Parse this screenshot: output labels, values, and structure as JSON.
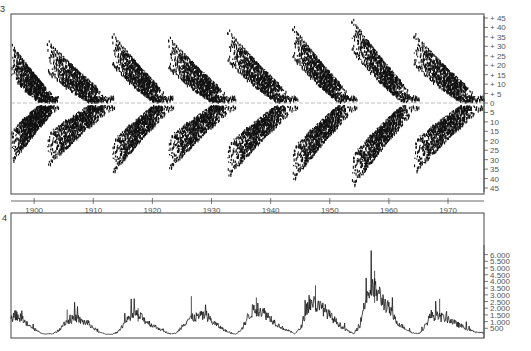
{
  "chart_data": [
    {
      "type": "scatter",
      "panel_label": "3",
      "title": "",
      "xlabel": "",
      "ylabel": "",
      "description": "Sunspot butterfly diagram: latitude of sunspot occurrence vs. time",
      "xlim": [
        1896,
        1976
      ],
      "ylim": [
        -45,
        45
      ],
      "x_ticks": [
        "1900",
        "1910",
        "1920",
        "1930",
        "1940",
        "1950",
        "1960",
        "1970"
      ],
      "y_ticks": [
        "+ 45",
        "+ 40",
        "+ 35",
        "+ 30",
        "+ 25",
        "+ 20",
        "+ 15",
        "+ 10",
        "+ 5",
        "0",
        "5",
        "10",
        "15",
        "20",
        "25",
        "30",
        "35",
        "40",
        "45"
      ],
      "y_tick_values": [
        45,
        40,
        35,
        30,
        25,
        20,
        15,
        10,
        5,
        0,
        -5,
        -10,
        -15,
        -20,
        -25,
        -30,
        -35,
        -40,
        -45
      ],
      "equator_line": true,
      "cycles": [
        {
          "start": 1896.0,
          "end": 1904.0,
          "max_lat": 30,
          "min_lat": 3
        },
        {
          "start": 1902.0,
          "end": 1913.5,
          "max_lat": 32,
          "min_lat": 3
        },
        {
          "start": 1913.0,
          "end": 1923.5,
          "max_lat": 36,
          "min_lat": 3
        },
        {
          "start": 1922.5,
          "end": 1934.0,
          "max_lat": 34,
          "min_lat": 3
        },
        {
          "start": 1932.5,
          "end": 1944.5,
          "max_lat": 38,
          "min_lat": 3
        },
        {
          "start": 1943.5,
          "end": 1954.5,
          "max_lat": 40,
          "min_lat": 3
        },
        {
          "start": 1953.5,
          "end": 1965.0,
          "max_lat": 44,
          "min_lat": 3
        },
        {
          "start": 1964.0,
          "end": 1976.0,
          "max_lat": 36,
          "min_lat": 3
        }
      ]
    },
    {
      "type": "line",
      "panel_label": "4",
      "title": "",
      "xlabel": "",
      "ylabel": "",
      "description": "Sunspot area over time",
      "xlim": [
        1896,
        1976
      ],
      "ylim": [
        0,
        6000
      ],
      "y_ticks": [
        "6.000",
        "5.500",
        "5.000",
        "4.500",
        "4.000",
        "3.500",
        "3.000",
        "2.500",
        "2.000",
        "1.500",
        "1.000",
        "500"
      ],
      "y_tick_values": [
        6000,
        5500,
        5000,
        4500,
        4000,
        3500,
        3000,
        2500,
        2000,
        1500,
        1000,
        500
      ],
      "grid": false,
      "x": [
        1896,
        1897,
        1898,
        1899,
        1900,
        1901,
        1902,
        1903,
        1904,
        1905,
        1906,
        1907,
        1908,
        1909,
        1910,
        1911,
        1912,
        1913,
        1914,
        1915,
        1916,
        1917,
        1918,
        1919,
        1920,
        1921,
        1922,
        1923,
        1924,
        1925,
        1926,
        1927,
        1928,
        1929,
        1930,
        1931,
        1932,
        1933,
        1934,
        1935,
        1936,
        1937,
        1938,
        1939,
        1940,
        1941,
        1942,
        1943,
        1944,
        1945,
        1946,
        1947,
        1948,
        1949,
        1950,
        1951,
        1952,
        1953,
        1954,
        1955,
        1956,
        1957,
        1958,
        1959,
        1960,
        1961,
        1962,
        1963,
        1964,
        1965,
        1966,
        1967,
        1968,
        1969,
        1970,
        1971,
        1972,
        1973,
        1974,
        1975,
        1976
      ],
      "values": [
        1300,
        1500,
        1100,
        700,
        400,
        150,
        80,
        80,
        300,
        900,
        1100,
        1300,
        1000,
        900,
        500,
        200,
        60,
        50,
        200,
        800,
        1200,
        1600,
        1300,
        1000,
        700,
        500,
        250,
        80,
        150,
        700,
        1200,
        1300,
        1400,
        1500,
        1000,
        700,
        400,
        150,
        80,
        400,
        1300,
        1900,
        1900,
        1600,
        1200,
        800,
        500,
        300,
        100,
        500,
        2000,
        2500,
        2100,
        1900,
        1400,
        1000,
        600,
        300,
        80,
        700,
        2800,
        3500,
        3200,
        2500,
        1900,
        1100,
        700,
        400,
        150,
        100,
        600,
        1500,
        1400,
        1300,
        1200,
        900,
        700,
        500,
        300,
        200,
        150
      ],
      "peaks": [
        {
          "x": 1905.5,
          "y": 1900
        },
        {
          "x": 1917.5,
          "y": 2000
        },
        {
          "x": 1926.5,
          "y": 2900
        },
        {
          "x": 1937.5,
          "y": 2800
        },
        {
          "x": 1947.5,
          "y": 3700
        },
        {
          "x": 1957.5,
          "y": 4800
        },
        {
          "x": 1968.5,
          "y": 2700
        }
      ]
    }
  ],
  "shared_x_axis": {
    "ticks": [
      "1900",
      "1910",
      "1920",
      "1930",
      "1940",
      "1950",
      "1960",
      "1970"
    ],
    "tick_values": [
      1900,
      1910,
      1920,
      1930,
      1940,
      1950,
      1960,
      1970
    ]
  }
}
